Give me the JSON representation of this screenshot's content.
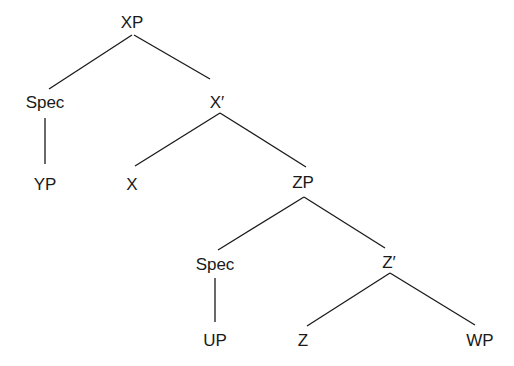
{
  "diagram": {
    "type": "syntax-tree",
    "nodes": [
      {
        "id": "xp",
        "label": "XP",
        "x": 132,
        "y": 22
      },
      {
        "id": "spec1",
        "label": "Spec",
        "x": 45,
        "y": 102
      },
      {
        "id": "xbar",
        "label": "X′",
        "x": 217,
        "y": 102
      },
      {
        "id": "yp",
        "label": "YP",
        "x": 45,
        "y": 184
      },
      {
        "id": "x",
        "label": "X",
        "x": 132,
        "y": 184
      },
      {
        "id": "zp",
        "label": "ZP",
        "x": 303,
        "y": 182
      },
      {
        "id": "spec2",
        "label": "Spec",
        "x": 215,
        "y": 264
      },
      {
        "id": "zbar",
        "label": "Z′",
        "x": 389,
        "y": 262
      },
      {
        "id": "up",
        "label": "UP",
        "x": 215,
        "y": 340
      },
      {
        "id": "z",
        "label": "Z",
        "x": 303,
        "y": 340
      },
      {
        "id": "wp",
        "label": "WP",
        "x": 480,
        "y": 340
      }
    ],
    "edges": [
      {
        "from": "xp",
        "to": "spec1",
        "x1": 132,
        "y1": 35,
        "x2": 49,
        "y2": 89
      },
      {
        "from": "xp",
        "to": "xbar",
        "x1": 134,
        "y1": 35,
        "x2": 210,
        "y2": 79
      },
      {
        "from": "spec1",
        "to": "yp",
        "x1": 45,
        "y1": 118,
        "x2": 45,
        "y2": 164
      },
      {
        "from": "xbar",
        "to": "x",
        "x1": 220,
        "y1": 113,
        "x2": 135,
        "y2": 166
      },
      {
        "from": "xbar",
        "to": "zp",
        "x1": 220,
        "y1": 113,
        "x2": 306,
        "y2": 167
      },
      {
        "from": "zp",
        "to": "spec2",
        "x1": 304,
        "y1": 197,
        "x2": 218,
        "y2": 250
      },
      {
        "from": "zp",
        "to": "zbar",
        "x1": 304,
        "y1": 197,
        "x2": 385,
        "y2": 248
      },
      {
        "from": "spec2",
        "to": "up",
        "x1": 215,
        "y1": 278,
        "x2": 215,
        "y2": 322
      },
      {
        "from": "zbar",
        "to": "z",
        "x1": 390,
        "y1": 273,
        "x2": 307,
        "y2": 326
      },
      {
        "from": "zbar",
        "to": "wp",
        "x1": 390,
        "y1": 273,
        "x2": 475,
        "y2": 325
      }
    ]
  }
}
